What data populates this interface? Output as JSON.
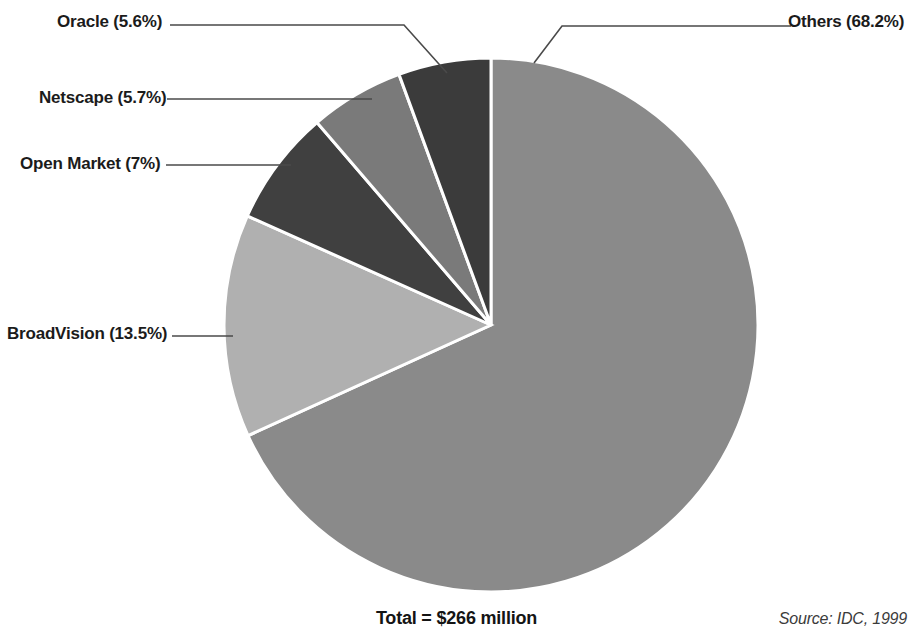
{
  "chart_data": {
    "type": "pie",
    "title": "",
    "subtitle": "",
    "total_label": "Total = $266 million",
    "source_note": "Source: IDC, 1999",
    "legend_position": "callout-labels",
    "grid": false,
    "start_angle_deg": 0,
    "direction": "clockwise-for-others",
    "categories": [
      "Others",
      "Oracle",
      "Netscape",
      "Open Market",
      "BroadVision"
    ],
    "values": [
      68.2,
      5.6,
      5.7,
      7.0,
      13.5
    ],
    "unit": "%",
    "slices": [
      {
        "name": "Others",
        "label": "Others (68.2%)",
        "value": 68.2,
        "color": "#8a8a8a",
        "start_deg": 0,
        "end_deg": 245.52
      },
      {
        "name": "Oracle",
        "label": "Oracle (5.6%)",
        "value": 5.6,
        "color": "#3b3b3b",
        "start_deg": 339.84,
        "end_deg": 360
      },
      {
        "name": "Netscape",
        "label": "Netscape (5.7%)",
        "value": 5.7,
        "color": "#7a7a7a",
        "start_deg": 319.32,
        "end_deg": 339.84
      },
      {
        "name": "Open Market",
        "label": "Open Market (7%)",
        "value": 7.0,
        "color": "#404040",
        "start_deg": 294.12,
        "end_deg": 319.32
      },
      {
        "name": "BroadVision",
        "label": "BroadVision (13.5%)",
        "value": 13.5,
        "color": "#b0b0b0",
        "start_deg": 245.52,
        "end_deg": 294.12
      }
    ],
    "xlabel": "",
    "ylabel": ""
  },
  "labels": {
    "oracle": "Oracle (5.6%)",
    "netscape": "Netscape (5.7%)",
    "open_market": "Open Market (7%)",
    "broadvision": "BroadVision (13.5%)",
    "others": "Others (68.2%)"
  },
  "footer": {
    "total": "Total = $266 million",
    "source": "Source: IDC, 1999"
  },
  "colors": {
    "others": "#8a8a8a",
    "oracle": "#3b3b3b",
    "netscape": "#7a7a7a",
    "open_market": "#404040",
    "broadvision": "#b0b0b0",
    "slice_border": "#ffffff",
    "leader_line": "#4a4a4a",
    "text": "#1b1b1b",
    "background": "#ffffff"
  }
}
